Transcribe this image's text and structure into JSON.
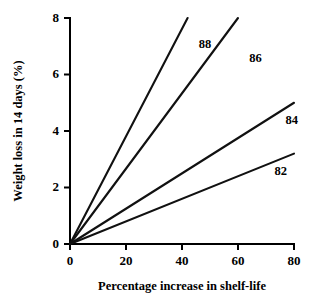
{
  "chart_data": {
    "type": "line",
    "title": "",
    "xlabel": "Percentage increase in shelf-life",
    "ylabel": "Weight loss in 14 days (%)",
    "xlim": [
      0,
      80
    ],
    "ylim": [
      0,
      8
    ],
    "xticks": [
      0,
      20,
      40,
      60,
      80
    ],
    "yticks": [
      0,
      2,
      4,
      6,
      8
    ],
    "xtick_labels": [
      "0",
      "20",
      "40",
      "60",
      "80"
    ],
    "ytick_labels": [
      "0",
      "2",
      "4",
      "6",
      "8"
    ],
    "grid": false,
    "legend": "inline-end-labels",
    "series": [
      {
        "name": "88",
        "label": "88",
        "slope": 0.1905,
        "x": [
          0,
          42
        ],
        "values": [
          0,
          8.0
        ],
        "color": "#111111"
      },
      {
        "name": "86",
        "label": "86",
        "slope": 0.1333,
        "x": [
          0,
          60
        ],
        "values": [
          0,
          8.0
        ],
        "color": "#111111"
      },
      {
        "name": "84",
        "label": "84",
        "slope": 0.0625,
        "x": [
          0,
          80
        ],
        "values": [
          0,
          5.0
        ],
        "color": "#111111"
      },
      {
        "name": "82",
        "label": "82",
        "slope": 0.04,
        "x": [
          0,
          80
        ],
        "values": [
          0,
          3.2
        ],
        "color": "#111111"
      }
    ],
    "series_label_positions": [
      {
        "name": "88",
        "x": 46,
        "y": 7.05
      },
      {
        "name": "86",
        "x": 64,
        "y": 6.55
      },
      {
        "name": "84",
        "x": 77,
        "y": 4.35
      },
      {
        "name": "82",
        "x": 73,
        "y": 2.55
      }
    ]
  }
}
